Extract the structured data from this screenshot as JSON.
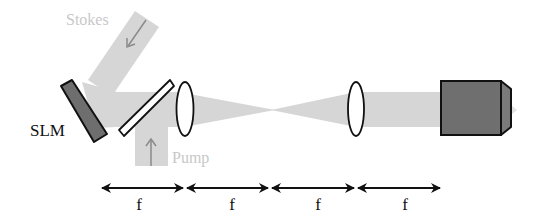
{
  "diagram": {
    "type": "optical-setup",
    "labels": {
      "stokes": "Stokes",
      "pump": "Pump",
      "slm": "SLM"
    },
    "distances": [
      {
        "label": "f"
      },
      {
        "label": "f"
      },
      {
        "label": "f"
      },
      {
        "label": "f"
      }
    ],
    "components": [
      {
        "name": "SLM",
        "kind": "spatial-light-modulator"
      },
      {
        "name": "dichroic-mirror",
        "kind": "beam-splitter"
      },
      {
        "name": "lens-1",
        "kind": "lens"
      },
      {
        "name": "lens-2",
        "kind": "lens"
      },
      {
        "name": "objective",
        "kind": "microscope-objective"
      }
    ],
    "colors": {
      "beam": "#d6d6d6",
      "beam_label": "#c8c8c8",
      "beam_arrow": "#8a8a8a",
      "slm_fill": "#6e6e6e",
      "objective_fill": "#6f6f6f",
      "outline": "#111111"
    }
  }
}
